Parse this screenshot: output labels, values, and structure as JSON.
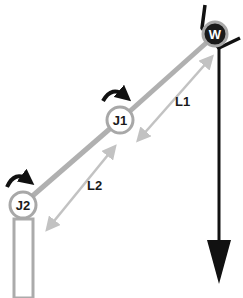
{
  "diagram": {
    "colors": {
      "link": "#b0b0b0",
      "joint_ring": "#a8a8a8",
      "dimension_arrow": "#c2c2c2",
      "ink": "#111111",
      "weight_fill": "#1a1a1a",
      "weight_text": "#ffffff"
    },
    "joints": [
      {
        "id": "J1",
        "label": "J1",
        "icon": "rotation-arrow-icon"
      },
      {
        "id": "J2",
        "label": "J2",
        "icon": "rotation-arrow-icon"
      }
    ],
    "end_effector": {
      "label": "W",
      "icon": "gripper-icon"
    },
    "links": [
      {
        "id": "L1",
        "label": "L1",
        "from": "J1",
        "to": "W"
      },
      {
        "id": "L2",
        "label": "L2",
        "from": "J2",
        "to": "J1"
      }
    ],
    "base": {
      "icon": "base-column-icon"
    },
    "force": {
      "icon": "gravity-arrow-icon",
      "direction": "down"
    }
  }
}
